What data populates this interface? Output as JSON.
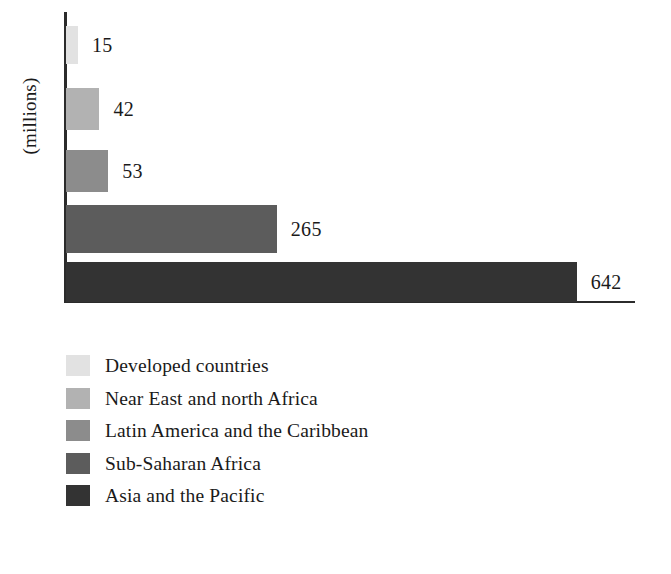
{
  "chart_data": {
    "type": "bar",
    "orientation": "horizontal",
    "title": "",
    "subtitle": "",
    "xlabel": "",
    "ylabel": "(millions)",
    "grid": false,
    "legend_position": "bottom-left",
    "axis_x_visible": true,
    "axis_y_visible": true,
    "xlim": [
      0,
      718
    ],
    "tick_labels_x": [],
    "tick_labels_y": [],
    "categories": [
      "Developed countries",
      "Near East and north Africa",
      "Latin America and the Caribbean",
      "Sub-Saharan Africa",
      "Asia and the Pacific"
    ],
    "values": [
      15,
      42,
      53,
      265,
      642
    ],
    "value_labels": [
      "15",
      "42",
      "53",
      "265",
      "642"
    ],
    "colors": [
      "#e2e2e2",
      "#b2b2b2",
      "#8c8c8c",
      "#5c5c5c",
      "#333333"
    ],
    "series": [
      {
        "name": "Number of undernourished people (millions)",
        "values": [
          15,
          42,
          53,
          265,
          642
        ]
      }
    ]
  },
  "axis": {
    "y_title": "(millions)"
  },
  "legend": {
    "items": [
      {
        "label": "Developed countries",
        "color": "#e2e2e2",
        "value": 15
      },
      {
        "label": "Near East and north Africa",
        "color": "#b2b2b2",
        "value": 42
      },
      {
        "label": "Latin America and the Caribbean",
        "color": "#8c8c8c",
        "value": 53
      },
      {
        "label": "Sub-Saharan Africa",
        "color": "#5c5c5c",
        "value": 265
      },
      {
        "label": "Asia and the Pacific",
        "color": "#333333",
        "value": 642
      }
    ]
  }
}
